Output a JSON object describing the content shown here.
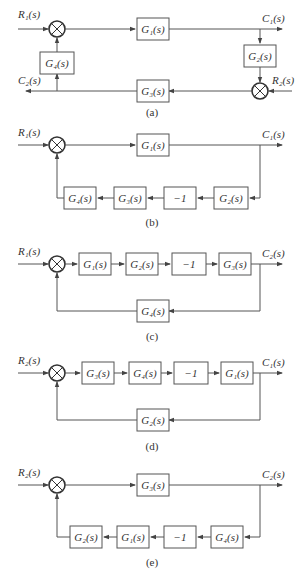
{
  "diagrams": [
    {
      "id": "a",
      "caption": "(a)",
      "inputs": [
        "R1(s)",
        "R2(s)"
      ],
      "outputs": [
        "C1(s)",
        "C2(s)"
      ],
      "blocks": [
        "G1(s)",
        "G2(s)",
        "G3(s)",
        "G4(s)"
      ],
      "labels": {
        "R1": "R₁(s)",
        "C1": "C₁(s)",
        "C2": "C₂(s)",
        "R2": "R₂(s)",
        "G1": "G₁(s)",
        "G2": "G₂(s)",
        "G3": "G₃(s)",
        "G4": "G₄(s)"
      }
    },
    {
      "id": "b",
      "caption": "(b)",
      "input": "R₁(s)",
      "output": "C₁(s)",
      "forward": [
        "G₁(s)"
      ],
      "feedback": [
        "G₄(s)",
        "G₃(s)",
        "−1",
        "G₂(s)"
      ]
    },
    {
      "id": "c",
      "caption": "(c)",
      "input": "R₁(s)",
      "output": "C₂(s)",
      "forward": [
        "G₁(s)",
        "G₂(s)",
        "−1",
        "G₃(s)"
      ],
      "feedback": [
        "G₄(s)"
      ]
    },
    {
      "id": "d",
      "caption": "(d)",
      "input": "R₂(s)",
      "output": "C₁(s)",
      "forward": [
        "G₃(s)",
        "G₄(s)",
        "−1",
        "G₁(s)"
      ],
      "feedback": [
        "G₂(s)"
      ]
    },
    {
      "id": "e",
      "caption": "(e)",
      "input": "R₂(s)",
      "output": "C₂(s)",
      "forward": [
        "G₃(s)"
      ],
      "feedback": [
        "G₂(s)",
        "G₁(s)",
        "−1",
        "G₄(s)"
      ]
    }
  ]
}
